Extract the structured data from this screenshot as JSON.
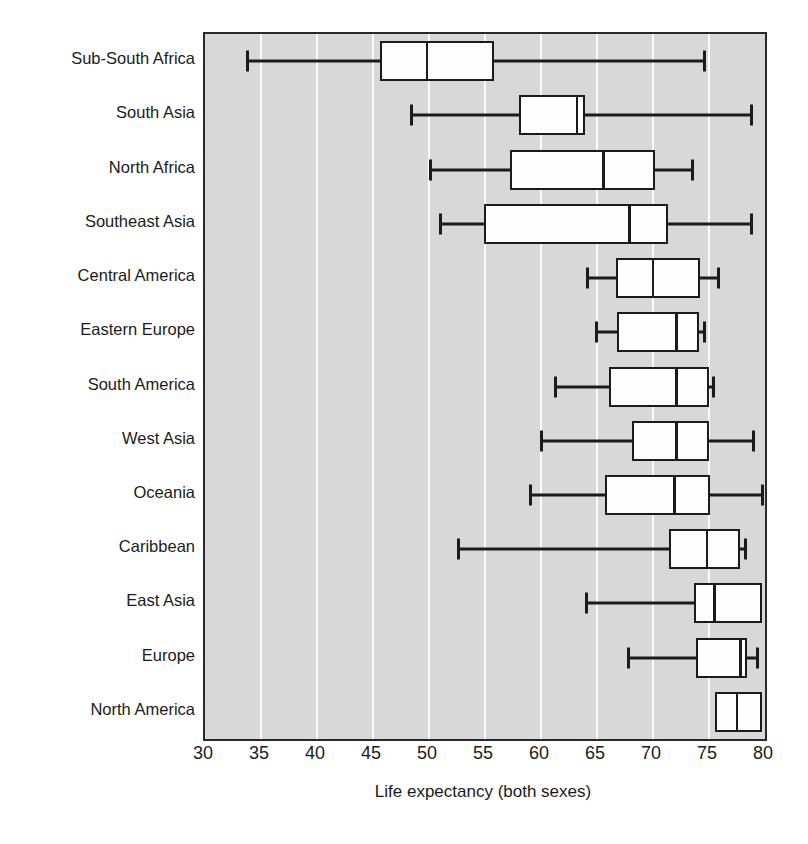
{
  "chart_data": {
    "type": "box",
    "title": "",
    "xlabel": "Life expectancy (both sexes)",
    "ylabel": "",
    "xlim": [
      30,
      80
    ],
    "xticks": [
      30,
      35,
      40,
      45,
      50,
      55,
      60,
      65,
      70,
      75,
      80
    ],
    "grid": "vertical",
    "legend": "none",
    "orientation": "horizontal",
    "categories": [
      "Sub-South Africa",
      "South Asia",
      "North Africa",
      "Southeast Asia",
      "Central America",
      "Eastern Europe",
      "South America",
      "West Asia",
      "Oceania",
      "Caribbean",
      "East Asia",
      "Europe",
      "North America"
    ],
    "boxes": [
      {
        "category": "Sub-South Africa",
        "min": 33.7,
        "q1": 45.6,
        "median": 49.8,
        "q3": 55.8,
        "max": 74.7
      },
      {
        "category": "South Asia",
        "min": 48.3,
        "q1": 58.0,
        "median": 63.2,
        "q3": 63.9,
        "max": 78.9
      },
      {
        "category": "North Africa",
        "min": 50.0,
        "q1": 57.2,
        "median": 65.6,
        "q3": 70.2,
        "max": 73.7
      },
      {
        "category": "Southeast Asia",
        "min": 50.9,
        "q1": 54.9,
        "median": 67.9,
        "q3": 71.3,
        "max": 78.9
      },
      {
        "category": "Central America",
        "min": 64.0,
        "q1": 66.7,
        "median": 70.0,
        "q3": 74.2,
        "max": 76.0
      },
      {
        "category": "Eastern Europe",
        "min": 64.8,
        "q1": 66.8,
        "median": 72.1,
        "q3": 74.1,
        "max": 74.7
      },
      {
        "category": "South America",
        "min": 61.2,
        "q1": 66.1,
        "median": 72.1,
        "q3": 75.0,
        "max": 75.5
      },
      {
        "category": "West Asia",
        "min": 59.9,
        "q1": 68.1,
        "median": 72.1,
        "q3": 75.0,
        "max": 79.1
      },
      {
        "category": "Oceania",
        "min": 58.9,
        "q1": 65.7,
        "median": 71.9,
        "q3": 75.1,
        "max": 79.9
      },
      {
        "category": "Caribbean",
        "min": 52.5,
        "q1": 71.4,
        "median": 74.8,
        "q3": 77.8,
        "max": 78.4
      },
      {
        "category": "East Asia",
        "min": 63.9,
        "q1": 73.7,
        "median": 75.5,
        "q3": 79.7,
        "max": 79.7
      },
      {
        "category": "Europe",
        "min": 67.7,
        "q1": 73.8,
        "median": 77.8,
        "q3": 78.4,
        "max": 79.5
      },
      {
        "category": "North America",
        "min": 75.5,
        "q1": 75.5,
        "median": 77.5,
        "q3": 79.7,
        "max": 79.7
      }
    ],
    "colors": {
      "plot_background": "#d8d8d8",
      "gridline": "#fbfbfb",
      "box_fill": "#fdfdfd",
      "ink": "#1b1b1b",
      "frame": "#2a2a2a"
    }
  }
}
